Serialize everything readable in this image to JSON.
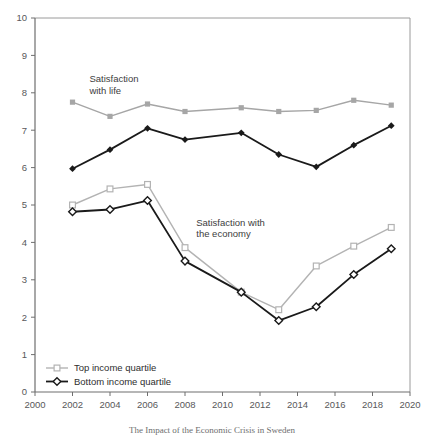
{
  "chart_data": {
    "type": "line",
    "title": "",
    "xlabel": "",
    "ylabel": "",
    "xlim": [
      2000,
      2020
    ],
    "ylim": [
      0,
      10
    ],
    "grid": false,
    "legend_position": "bottom-left",
    "x": [
      2002,
      2004,
      2006,
      2008,
      2011,
      2013,
      2015,
      2017,
      2019
    ],
    "xticks": [
      "2000",
      "2002",
      "2004",
      "2006",
      "2008",
      "2010",
      "2012",
      "2014",
      "2016",
      "2018",
      "2020"
    ],
    "xtick_values": [
      2000,
      2002,
      2004,
      2006,
      2008,
      2010,
      2012,
      2014,
      2016,
      2018,
      2020
    ],
    "yticks": [
      "0",
      "1",
      "2",
      "3",
      "4",
      "5",
      "6",
      "7",
      "8",
      "9",
      "10"
    ],
    "ytick_values": [
      0,
      1,
      2,
      3,
      4,
      5,
      6,
      7,
      8,
      9,
      10
    ],
    "series": [
      {
        "name": "Top income quartile",
        "group": "Satisfaction with life",
        "marker": "filled-square",
        "color": "#a6a6a6",
        "values": [
          7.75,
          7.37,
          7.7,
          7.5,
          7.6,
          7.5,
          7.53,
          7.8,
          7.67
        ]
      },
      {
        "name": "Bottom income quartile",
        "group": "Satisfaction with life",
        "marker": "filled-diamond",
        "color": "#1a1a1a",
        "values": [
          5.97,
          6.48,
          7.05,
          6.75,
          6.93,
          6.35,
          6.02,
          6.6,
          7.12
        ]
      },
      {
        "name": "Top income quartile",
        "group": "Satisfaction with the economy",
        "marker": "open-square",
        "color": "#b3b3b3",
        "values": [
          5.0,
          5.43,
          5.55,
          3.86,
          2.67,
          2.2,
          3.37,
          3.9,
          4.4
        ]
      },
      {
        "name": "Bottom income quartile",
        "group": "Satisfaction with the economy",
        "marker": "open-diamond",
        "color": "#1a1a1a",
        "values": [
          4.82,
          4.88,
          5.12,
          3.5,
          2.67,
          1.91,
          2.28,
          3.14,
          3.83
        ]
      }
    ],
    "annotations": [
      {
        "id": "life",
        "line1": "Satisfaction",
        "line2": "with life",
        "x": 2002.9,
        "y": 8.28
      },
      {
        "id": "economy",
        "line1": "Satisfaction with",
        "line2": "the economy",
        "x": 2008.6,
        "y": 4.45
      }
    ],
    "legend": [
      {
        "label": "Top income quartile",
        "marker": "open-square",
        "color": "#b3b3b3"
      },
      {
        "label": "Bottom income quartile",
        "marker": "open-diamond",
        "color": "#1a1a1a"
      }
    ],
    "caption": "The Impact of the Economic Crisis in Sweden"
  }
}
